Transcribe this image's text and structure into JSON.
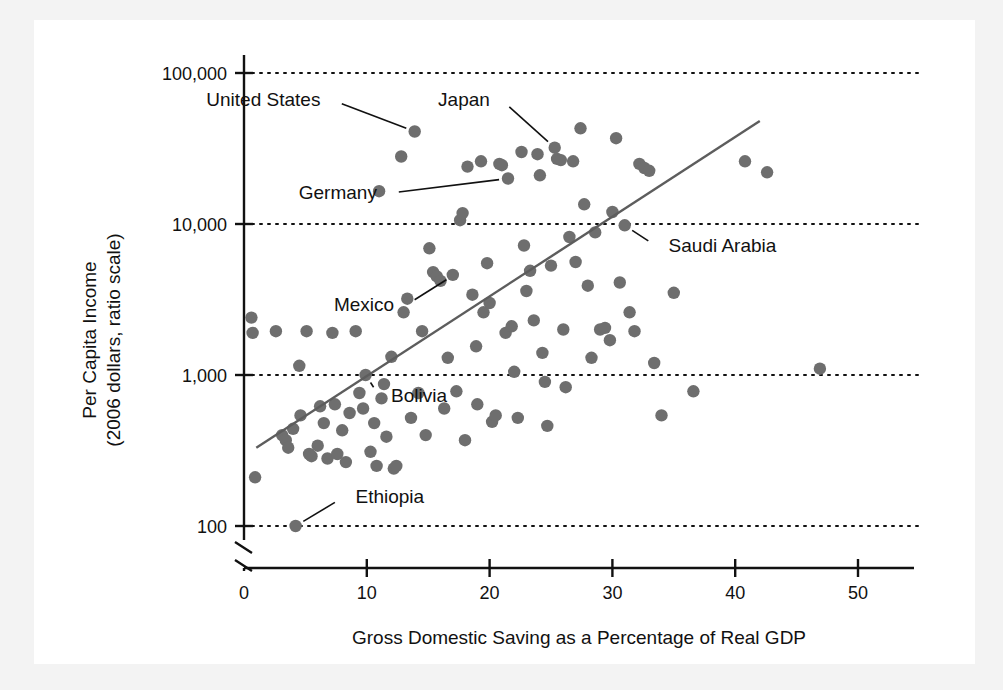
{
  "figure": {
    "kind": "scatter-plot",
    "background_color": "#ffffff",
    "dot_color": "#6e6e6e",
    "line_color": "#5d5d5d"
  },
  "chart_data": {
    "type": "scatter",
    "title": "",
    "xlabel": "Gross Domestic Saving as a Percentage of Real GDP",
    "ylabel": "Per Capita Income\n(2006 dollars, ratio scale)",
    "ylabel_line1": "Per Capita Income",
    "ylabel_line2": "(2006 dollars, ratio scale)",
    "xlim": [
      0,
      56
    ],
    "ylim_log": [
      100,
      100000
    ],
    "yscale": "log",
    "y_axis_break": true,
    "grid": "horizontal-dotted",
    "legend": "none",
    "xticks": [
      0,
      10,
      20,
      30,
      40,
      50
    ],
    "xtick_labels": [
      "0",
      "10",
      "20",
      "30",
      "40",
      "50"
    ],
    "yticks": [
      100,
      1000,
      10000,
      100000
    ],
    "ytick_labels": [
      "100",
      "1,000",
      "10,000",
      "100,000"
    ],
    "trendline": {
      "x_start": 1.0,
      "y_start": 330,
      "x_end": 42.0,
      "y_end": 48000
    },
    "annotations": [
      {
        "label": "United States",
        "x": 13.9,
        "y": 41000,
        "text_x": 7.2,
        "text_y": 66000
      },
      {
        "label": "Japan",
        "x": 25.3,
        "y": 32000,
        "text_x": 21.0,
        "text_y": 66000
      },
      {
        "label": "Germany",
        "x": 21.5,
        "y": 20000,
        "text_x": 11.8,
        "text_y": 16000
      },
      {
        "label": "Saudi Arabia",
        "x": 31.0,
        "y": 9800,
        "text_x": 33.6,
        "text_y": 7100
      },
      {
        "label": "Mexico",
        "x": 17.1,
        "y": 4600,
        "text_x": 13.2,
        "text_y": 2900
      },
      {
        "label": "Bolivia",
        "x": 9.9,
        "y": 1000,
        "text_x": 11.0,
        "text_y": 730
      },
      {
        "label": "Ethiopia",
        "x": 4.2,
        "y": 100,
        "text_x": 8.1,
        "text_y": 155
      }
    ],
    "points": [
      {
        "x": 0.6,
        "y": 2400
      },
      {
        "x": 0.7,
        "y": 1900
      },
      {
        "x": 0.9,
        "y": 210
      },
      {
        "x": 2.6,
        "y": 1950
      },
      {
        "x": 3.1,
        "y": 400
      },
      {
        "x": 3.4,
        "y": 370
      },
      {
        "x": 3.6,
        "y": 330
      },
      {
        "x": 4.0,
        "y": 440
      },
      {
        "x": 4.2,
        "y": 100
      },
      {
        "x": 4.5,
        "y": 1150
      },
      {
        "x": 4.6,
        "y": 540
      },
      {
        "x": 5.1,
        "y": 1950
      },
      {
        "x": 5.3,
        "y": 300
      },
      {
        "x": 5.5,
        "y": 290
      },
      {
        "x": 6.0,
        "y": 340
      },
      {
        "x": 6.2,
        "y": 620
      },
      {
        "x": 6.5,
        "y": 480
      },
      {
        "x": 6.8,
        "y": 280
      },
      {
        "x": 7.2,
        "y": 1900
      },
      {
        "x": 7.4,
        "y": 640
      },
      {
        "x": 7.6,
        "y": 300
      },
      {
        "x": 8.0,
        "y": 430
      },
      {
        "x": 8.3,
        "y": 265
      },
      {
        "x": 8.6,
        "y": 560
      },
      {
        "x": 9.1,
        "y": 1950
      },
      {
        "x": 9.4,
        "y": 760
      },
      {
        "x": 9.7,
        "y": 600
      },
      {
        "x": 9.9,
        "y": 1000
      },
      {
        "x": 10.3,
        "y": 310
      },
      {
        "x": 10.6,
        "y": 480
      },
      {
        "x": 10.8,
        "y": 250
      },
      {
        "x": 11.0,
        "y": 16500
      },
      {
        "x": 11.2,
        "y": 700
      },
      {
        "x": 11.4,
        "y": 870
      },
      {
        "x": 11.6,
        "y": 390
      },
      {
        "x": 12.0,
        "y": 1320
      },
      {
        "x": 12.2,
        "y": 240
      },
      {
        "x": 12.4,
        "y": 250
      },
      {
        "x": 12.8,
        "y": 28000
      },
      {
        "x": 13.0,
        "y": 2600
      },
      {
        "x": 13.3,
        "y": 3200
      },
      {
        "x": 13.6,
        "y": 520
      },
      {
        "x": 13.9,
        "y": 41000
      },
      {
        "x": 14.2,
        "y": 760
      },
      {
        "x": 14.5,
        "y": 1950
      },
      {
        "x": 14.8,
        "y": 400
      },
      {
        "x": 15.1,
        "y": 6900
      },
      {
        "x": 15.4,
        "y": 4800
      },
      {
        "x": 15.7,
        "y": 4500
      },
      {
        "x": 16.0,
        "y": 4200
      },
      {
        "x": 16.3,
        "y": 600
      },
      {
        "x": 16.6,
        "y": 1300
      },
      {
        "x": 17.0,
        "y": 4600
      },
      {
        "x": 17.3,
        "y": 780
      },
      {
        "x": 17.6,
        "y": 10600
      },
      {
        "x": 17.8,
        "y": 11800
      },
      {
        "x": 18.0,
        "y": 370
      },
      {
        "x": 18.2,
        "y": 24000
      },
      {
        "x": 18.6,
        "y": 3400
      },
      {
        "x": 18.9,
        "y": 1550
      },
      {
        "x": 19.0,
        "y": 640
      },
      {
        "x": 19.3,
        "y": 26000
      },
      {
        "x": 19.5,
        "y": 2600
      },
      {
        "x": 19.8,
        "y": 5500
      },
      {
        "x": 20.0,
        "y": 3000
      },
      {
        "x": 20.2,
        "y": 490
      },
      {
        "x": 20.5,
        "y": 540
      },
      {
        "x": 20.8,
        "y": 25000
      },
      {
        "x": 21.0,
        "y": 24500
      },
      {
        "x": 21.3,
        "y": 1900
      },
      {
        "x": 21.5,
        "y": 20000
      },
      {
        "x": 21.8,
        "y": 2100
      },
      {
        "x": 22.0,
        "y": 1050
      },
      {
        "x": 22.3,
        "y": 520
      },
      {
        "x": 22.6,
        "y": 30000
      },
      {
        "x": 22.8,
        "y": 7200
      },
      {
        "x": 23.0,
        "y": 3600
      },
      {
        "x": 23.3,
        "y": 4900
      },
      {
        "x": 23.6,
        "y": 2300
      },
      {
        "x": 23.9,
        "y": 29000
      },
      {
        "x": 24.1,
        "y": 21000
      },
      {
        "x": 24.3,
        "y": 1400
      },
      {
        "x": 24.5,
        "y": 900
      },
      {
        "x": 24.7,
        "y": 460
      },
      {
        "x": 25.0,
        "y": 5300
      },
      {
        "x": 25.3,
        "y": 32000
      },
      {
        "x": 25.5,
        "y": 27000
      },
      {
        "x": 25.8,
        "y": 26500
      },
      {
        "x": 26.0,
        "y": 2000
      },
      {
        "x": 26.2,
        "y": 830
      },
      {
        "x": 26.5,
        "y": 8200
      },
      {
        "x": 26.8,
        "y": 26000
      },
      {
        "x": 27.0,
        "y": 5600
      },
      {
        "x": 27.4,
        "y": 43000
      },
      {
        "x": 27.7,
        "y": 13500
      },
      {
        "x": 28.0,
        "y": 3900
      },
      {
        "x": 28.3,
        "y": 1300
      },
      {
        "x": 28.6,
        "y": 8800
      },
      {
        "x": 29.0,
        "y": 2000
      },
      {
        "x": 29.4,
        "y": 2050
      },
      {
        "x": 29.8,
        "y": 1700
      },
      {
        "x": 30.0,
        "y": 12000
      },
      {
        "x": 30.3,
        "y": 37000
      },
      {
        "x": 30.6,
        "y": 4100
      },
      {
        "x": 31.0,
        "y": 9800
      },
      {
        "x": 31.4,
        "y": 2600
      },
      {
        "x": 31.8,
        "y": 1950
      },
      {
        "x": 32.2,
        "y": 25000
      },
      {
        "x": 32.6,
        "y": 23500
      },
      {
        "x": 33.0,
        "y": 22500
      },
      {
        "x": 33.4,
        "y": 1200
      },
      {
        "x": 34.0,
        "y": 540
      },
      {
        "x": 35.0,
        "y": 3500
      },
      {
        "x": 36.6,
        "y": 780
      },
      {
        "x": 40.8,
        "y": 26000
      },
      {
        "x": 42.6,
        "y": 22000
      },
      {
        "x": 46.9,
        "y": 1100
      }
    ]
  }
}
